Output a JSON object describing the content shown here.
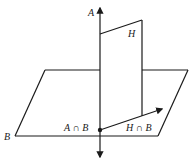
{
  "diagram": {
    "labels": {
      "line_a": "A",
      "plane_h": "H",
      "plane_b": "B",
      "intersection_ab": "A ∩ B",
      "intersection_hb": "H ∩ B"
    },
    "colors": {
      "stroke": "#1a1a1a",
      "background": "#ffffff"
    }
  }
}
